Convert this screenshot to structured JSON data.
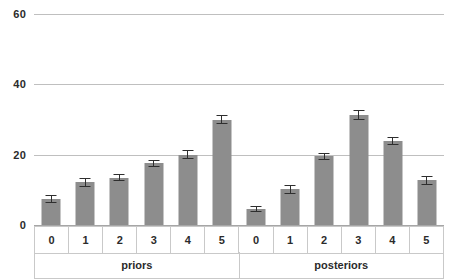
{
  "chart_data": {
    "type": "bar",
    "title": "",
    "subtitle": "",
    "xlabel": "",
    "ylabel": "",
    "ylim": [
      0,
      60
    ],
    "yticks": [
      0,
      20,
      40,
      60
    ],
    "ytick_labels": [
      "0",
      "20",
      "40",
      "60"
    ],
    "grid": true,
    "legend": "none",
    "bar_color": "#8d8d8d",
    "errorbar_color": "#2e2e2e",
    "gridline_color": "#bfbfbf",
    "groups": [
      {
        "name": "priors",
        "categories": [
          "0",
          "1",
          "2",
          "3",
          "4",
          "5"
        ],
        "values": [
          7.3,
          12.1,
          13.5,
          17.5,
          20.0,
          30.0
        ],
        "errors": [
          1.1,
          1.3,
          0.9,
          1.0,
          1.3,
          1.4
        ]
      },
      {
        "name": "posteriors",
        "categories": [
          "0",
          "1",
          "2",
          "3",
          "4",
          "5"
        ],
        "values": [
          4.5,
          10.1,
          19.5,
          31.3,
          23.9,
          12.7
        ],
        "errors": [
          0.9,
          1.2,
          1.0,
          1.3,
          1.2,
          1.3
        ]
      }
    ]
  }
}
